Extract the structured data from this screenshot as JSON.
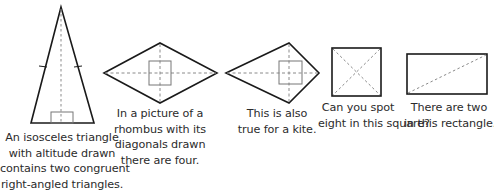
{
  "colors": {
    "outline": "#1a1a1a",
    "dashed": "#8a8a8a",
    "marker": "#777777",
    "text": "#2b2b2b"
  },
  "figures": [
    {
      "shape": "isosceles-triangle",
      "features": [
        "altitude (dashed)",
        "right-angle marker",
        "equal-side tick marks"
      ],
      "caption": [
        "An isosceles triangle",
        "with altitude drawn",
        "contains two congruent",
        "right-angled triangles."
      ]
    },
    {
      "shape": "rhombus",
      "features": [
        "two diagonals (dashed)",
        "right-angle marker at intersection"
      ],
      "caption": [
        "In a picture of a",
        "rhombus with its",
        "diagonals drawn",
        "there are four."
      ]
    },
    {
      "shape": "kite",
      "features": [
        "two diagonals (dashed)",
        "right-angle marker at intersection"
      ],
      "caption": [
        "This is also",
        "true for a kite."
      ]
    },
    {
      "shape": "square",
      "features": [
        "two diagonals (dashed)"
      ],
      "caption": [
        "Can you spot",
        "eight in this square?"
      ]
    },
    {
      "shape": "rectangle",
      "features": [
        "one diagonal (dashed)"
      ],
      "caption": [
        "There are two",
        "in this rectangle."
      ]
    }
  ]
}
